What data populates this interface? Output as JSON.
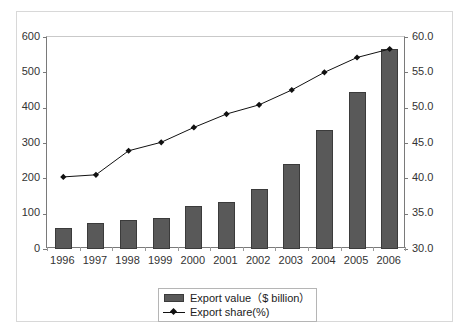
{
  "chart_data": {
    "type": "bar",
    "title": "",
    "xlabel": "",
    "ylabel": "",
    "grid": false,
    "legend_position": "bottom-center",
    "categories": [
      "1996",
      "1997",
      "1998",
      "1999",
      "2000",
      "2001",
      "2002",
      "2003",
      "2004",
      "2005",
      "2006"
    ],
    "series": [
      {
        "name": "Export value（$ billion）",
        "type": "bar",
        "axis": "left",
        "color": "#595959",
        "values": [
          60,
          75,
          82,
          89,
          121,
          133,
          170,
          240,
          338,
          443,
          565
        ]
      },
      {
        "name": "Export share(%)",
        "type": "line",
        "axis": "right",
        "color": "#111111",
        "marker": "diamond",
        "values": [
          40.2,
          40.5,
          43.9,
          45.1,
          47.2,
          49.1,
          50.4,
          52.5,
          55.0,
          57.1,
          58.3
        ]
      }
    ],
    "left_axis": {
      "label": "",
      "ylim": [
        0,
        600
      ],
      "ticks": [
        "0",
        "100",
        "200",
        "300",
        "400",
        "500",
        "600"
      ],
      "tick_values": [
        0,
        100,
        200,
        300,
        400,
        500,
        600
      ]
    },
    "right_axis": {
      "label": "",
      "ylim": [
        30.0,
        60.0
      ],
      "ticks": [
        "30.0",
        "35.0",
        "40.0",
        "45.0",
        "50.0",
        "55.0",
        "60.0"
      ],
      "tick_values": [
        30.0,
        35.0,
        40.0,
        45.0,
        50.0,
        55.0,
        60.0
      ]
    }
  },
  "legend": {
    "items": [
      {
        "label": "Export value（$ billion）",
        "marker": "bar-swatch"
      },
      {
        "label": "Export share(%)",
        "marker": "line-marker-swatch"
      }
    ]
  },
  "colors": {
    "bar_fill": "#595959",
    "bar_stroke": "#3b3b3b",
    "line": "#111111",
    "axis": "#7a7a7a",
    "frame": "#d8d8d8",
    "text": "#333333",
    "background": "#ffffff"
  }
}
